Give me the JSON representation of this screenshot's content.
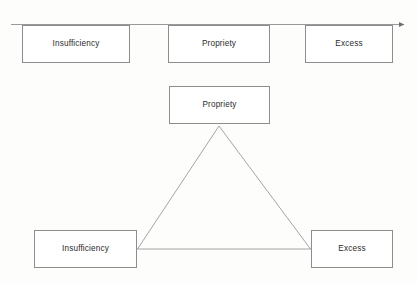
{
  "diagram": {
    "background_color": "#fdfdfc",
    "stroke_color": "#8d8d8d",
    "text_color": "#2b2b2b",
    "axis": {
      "name": "horizontal-progression-axis",
      "arrow_direction": "right",
      "line": {
        "x1": 11,
        "y1": 24,
        "x2": 408,
        "y2": 24
      },
      "boxes": [
        {
          "label": "Insufficiency"
        },
        {
          "label": "Propriety"
        },
        {
          "label": "Excess"
        }
      ]
    },
    "triangle": {
      "name": "propriety-triangle",
      "apex": {
        "label": "Propriety"
      },
      "bottom_left": {
        "label": "Insufficiency"
      },
      "bottom_right": {
        "label": "Excess"
      },
      "vertices": {
        "apex": {
          "x": 219,
          "y": 126
        },
        "left": {
          "x": 137,
          "y": 249
        },
        "right": {
          "x": 311,
          "y": 249
        }
      }
    }
  }
}
